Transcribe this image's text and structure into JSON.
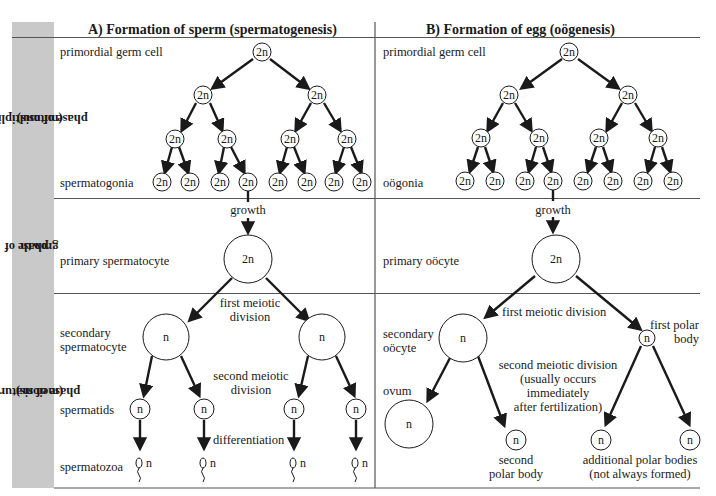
{
  "columns": {
    "a": {
      "title": "A) Formation of sperm (spermatogenesis)"
    },
    "b": {
      "title": "B) Formation of egg (oögenesis)"
    }
  },
  "phases": [
    {
      "id": "multiplication",
      "label_line1": "phase of multiplication",
      "label_line2": "(mitosis)"
    },
    {
      "id": "growth",
      "label_line1": "phase of",
      "label_line2": "growth"
    },
    {
      "id": "maturation",
      "label_line1": "phase of maturation",
      "label_line2": "(meiosis)"
    }
  ],
  "sperm": {
    "primordial": "primordial germ cell",
    "spermatogonia": "spermatogonia",
    "growth": "growth",
    "primary": "primary spermatocyte",
    "first_div_1": "first meiotic",
    "first_div_2": "division",
    "secondary_1": "secondary",
    "secondary_2": "spermatocyte",
    "second_div_1": "second meiotic",
    "second_div_2": "division",
    "spermatids": "spermatids",
    "differentiation": "differentiation",
    "spermatozoa": "spermatozoa"
  },
  "egg": {
    "primordial": "primordial germ cell",
    "oogonia": "oögonia",
    "growth": "growth",
    "primary": "primary oöcyte",
    "first_div": "first meiotic division",
    "secondary_1": "secondary",
    "secondary_2": "oöcyte",
    "first_polar_1": "first polar",
    "first_polar_2": "body",
    "second_div_1": "second meiotic division",
    "second_div_2": "(usually occurs",
    "second_div_3": "immediately",
    "second_div_4": "after fertilization)",
    "ovum": "ovum",
    "second_polar_1": "second",
    "second_polar_2": "polar body",
    "additional_1": "additional polar bodies",
    "additional_2": "(not always formed)"
  },
  "ploidy": {
    "diploid": "2n",
    "haploid": "n"
  },
  "colors": {
    "side_band": "#c9c9c9",
    "ink": "#1a1a1a",
    "rule": "#555555"
  }
}
